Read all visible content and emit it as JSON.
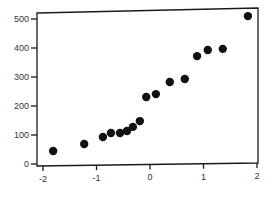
{
  "chart_data": {
    "type": "scatter",
    "title": "",
    "xlabel": "",
    "ylabel": "",
    "xlim": [
      -2,
      2
    ],
    "ylim": [
      0,
      520
    ],
    "grid": false,
    "legend": null,
    "x_ticks": [
      -2,
      -1,
      0,
      1,
      2
    ],
    "x_tick_labels": [
      "-2",
      "-1",
      "0",
      "1",
      "2"
    ],
    "y_ticks": [
      0,
      100,
      200,
      300,
      400,
      500
    ],
    "y_tick_labels": [
      "0",
      "100",
      "200",
      "300",
      "400",
      "500"
    ],
    "series": [
      {
        "name": "points",
        "color": "#111111",
        "x": [
          -1.81,
          -1.23,
          -0.88,
          -0.73,
          -0.56,
          -0.43,
          -0.32,
          -0.19,
          -0.07,
          0.11,
          0.37,
          0.65,
          0.88,
          1.08,
          1.36,
          1.83
        ],
        "y": [
          45,
          69,
          93,
          107,
          107,
          114,
          128,
          148,
          231,
          241,
          283,
          293,
          372,
          393,
          397,
          510
        ]
      }
    ]
  }
}
